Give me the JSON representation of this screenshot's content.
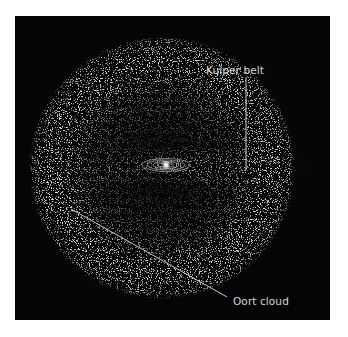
{
  "diagram": {
    "background_color": "#050505",
    "page_background": "#ffffff",
    "label_color": "#d6d6d6",
    "line_color": "#c8c8c8",
    "labels": {
      "kuiper_belt": "Kuiper belt",
      "oort_cloud": "Oort cloud"
    },
    "elements": [
      {
        "name": "sun",
        "label": ""
      },
      {
        "name": "planetary-orbits",
        "label": ""
      },
      {
        "name": "kuiper-belt-disc",
        "label": "Kuiper belt"
      },
      {
        "name": "oort-cloud-shell",
        "label": "Oort cloud"
      }
    ]
  }
}
